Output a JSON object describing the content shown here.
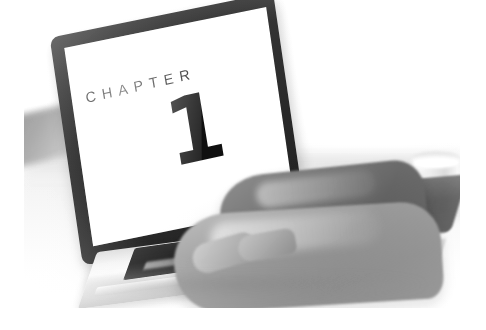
{
  "page": {
    "background_color": "#ffffff",
    "width": 486,
    "height": 330
  },
  "photo": {
    "name": "chapter-opener-photograph",
    "description": "Grayscale photograph of a laptop on a white desk with a person's hands typing on the keyboard and a white coffee cup at the right.",
    "color_mode": "grayscale",
    "x": 24,
    "y": 0,
    "width": 436,
    "height": 308
  },
  "screen": {
    "chapter_label": "CHAPTER",
    "chapter_number": "1",
    "background_color": "#ffffff",
    "text_color": "#141414"
  },
  "objects": {
    "laptop_bezel_color": "#2b2b2b",
    "laptop_base_color": "#eeeeee",
    "keyboard_color": "#1a1a1a",
    "hand_color": "#9a9a9a",
    "cup_color": "#f2f2f2",
    "desk_color": "#f6f6f6"
  }
}
